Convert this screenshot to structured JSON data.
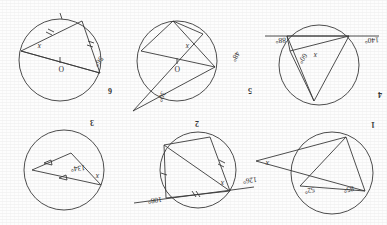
{
  "document": {
    "kind": "scanned-geometry-worksheet",
    "orientation_note": "upside-down scan",
    "page_background": "#fdfdfd",
    "ink_color": "#3a3a3a"
  },
  "problems": [
    {
      "number": "1",
      "labels": [
        {
          "id": "p1-85",
          "text": "85°"
        },
        {
          "id": "p1-52",
          "text": "52°"
        },
        {
          "id": "p1-x",
          "text": "x"
        }
      ]
    },
    {
      "number": "2",
      "labels": [
        {
          "id": "p2-126",
          "text": "126°"
        },
        {
          "id": "p2-108",
          "text": "108°"
        },
        {
          "id": "p2-x",
          "text": "x"
        }
      ]
    },
    {
      "number": "3",
      "labels": [
        {
          "id": "p3-134",
          "text": "134°"
        },
        {
          "id": "p3-x",
          "text": "x"
        }
      ]
    },
    {
      "number": "4",
      "labels": [
        {
          "id": "p4-140",
          "text": "140°"
        },
        {
          "id": "p4-88",
          "text": "88°"
        },
        {
          "id": "p4-60",
          "text": "60°"
        },
        {
          "id": "p4-x",
          "text": "x"
        }
      ]
    },
    {
      "number": "5",
      "labels": [
        {
          "id": "p5-30",
          "text": "30°"
        },
        {
          "id": "p5-48",
          "text": "48°"
        },
        {
          "id": "p5-O",
          "text": "O"
        },
        {
          "id": "p5-x",
          "text": "x"
        }
      ]
    },
    {
      "number": "6",
      "labels": [
        {
          "id": "p6-56",
          "text": "56°"
        },
        {
          "id": "p6-O",
          "text": "O"
        },
        {
          "id": "p6-x",
          "text": "x"
        }
      ]
    }
  ]
}
